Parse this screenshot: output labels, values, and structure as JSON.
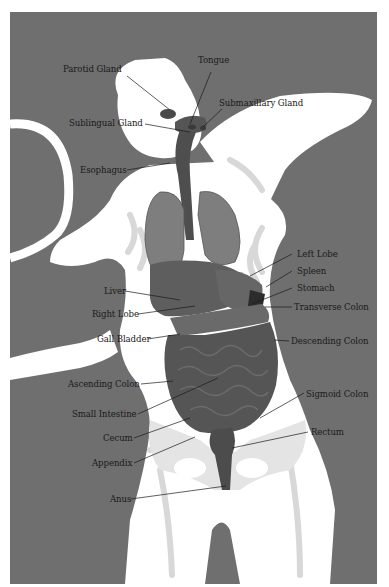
{
  "figure": {
    "type": "anatomical-illustration",
    "background_color": "#6e6e6e",
    "silhouette_color": "#ffffff",
    "organ_color": "#5a5a5a"
  },
  "labels": [
    {
      "id": "parotid-gland",
      "text": "Parotid Gland",
      "x": 63,
      "y": 69,
      "align": "left",
      "line": [
        127,
        76,
        170,
        110
      ]
    },
    {
      "id": "tongue",
      "text": "Tongue",
      "x": 198,
      "y": 60,
      "align": "left",
      "line": [
        211,
        72,
        190,
        124
      ]
    },
    {
      "id": "submaxillary-gland",
      "text": "Submaxillary Gland",
      "x": 219,
      "y": 98,
      "align": "left",
      "line": [
        222,
        109,
        203,
        127
      ]
    },
    {
      "id": "sublingual-gland",
      "text": "Sublingual Gland",
      "x": 69,
      "y": 118,
      "align": "left",
      "line": [
        145,
        124,
        190,
        132
      ]
    },
    {
      "id": "esophagus",
      "text": "Esophagus",
      "x": 80,
      "y": 166,
      "align": "left",
      "line": [
        127,
        170,
        170,
        163
      ]
    },
    {
      "id": "left-lobe",
      "text": "Left Lobe",
      "x": 297,
      "y": 249,
      "align": "left",
      "line": [
        292,
        254,
        250,
        276
      ]
    },
    {
      "id": "spleen",
      "text": "Spleen",
      "x": 297,
      "y": 266,
      "align": "left",
      "line": [
        292,
        271,
        266,
        287
      ]
    },
    {
      "id": "stomach",
      "text": "Stomach",
      "x": 297,
      "y": 283,
      "align": "left",
      "line": [
        292,
        288,
        252,
        304
      ]
    },
    {
      "id": "liver",
      "text": "Liver",
      "x": 104,
      "y": 286,
      "align": "left",
      "line": [
        125,
        291,
        180,
        300
      ]
    },
    {
      "id": "transverse-colon",
      "text": "Transverse Colon",
      "x": 294,
      "y": 302,
      "align": "left",
      "line": [
        292,
        307,
        265,
        307
      ]
    },
    {
      "id": "right-lobe",
      "text": "Right Lobe",
      "x": 92,
      "y": 309,
      "align": "left",
      "line": [
        138,
        314,
        195,
        306
      ]
    },
    {
      "id": "gall-bladder",
      "text": "Gall Bladder",
      "x": 97,
      "y": 335,
      "align": "left",
      "line": [
        148,
        339,
        180,
        334
      ]
    },
    {
      "id": "descending-colon",
      "text": "Descending Colon",
      "x": 291,
      "y": 336,
      "align": "left",
      "line": [
        289,
        341,
        274,
        340
      ]
    },
    {
      "id": "ascending-colon",
      "text": "Ascending Colon",
      "x": 68,
      "y": 379,
      "align": "left",
      "line": [
        141,
        384,
        173,
        381
      ]
    },
    {
      "id": "sigmoid-colon",
      "text": "Sigmoid Colon",
      "x": 306,
      "y": 389,
      "align": "left",
      "line": [
        304,
        393,
        260,
        418
      ]
    },
    {
      "id": "small-intestine",
      "text": "Small Intestine",
      "x": 72,
      "y": 409,
      "align": "left",
      "line": [
        138,
        414,
        218,
        378
      ]
    },
    {
      "id": "rectum",
      "text": "Rectum",
      "x": 311,
      "y": 427,
      "align": "left",
      "line": [
        308,
        432,
        232,
        448
      ]
    },
    {
      "id": "cecum",
      "text": "Cecum",
      "x": 103,
      "y": 434,
      "align": "left",
      "line": [
        134,
        438,
        190,
        418
      ]
    },
    {
      "id": "appendix",
      "text": "Appendix",
      "x": 92,
      "y": 459,
      "align": "left",
      "line": [
        134,
        463,
        195,
        437
      ]
    },
    {
      "id": "anus",
      "text": "Anus",
      "x": 110,
      "y": 495,
      "align": "left",
      "line": [
        131,
        499,
        226,
        486
      ]
    }
  ]
}
